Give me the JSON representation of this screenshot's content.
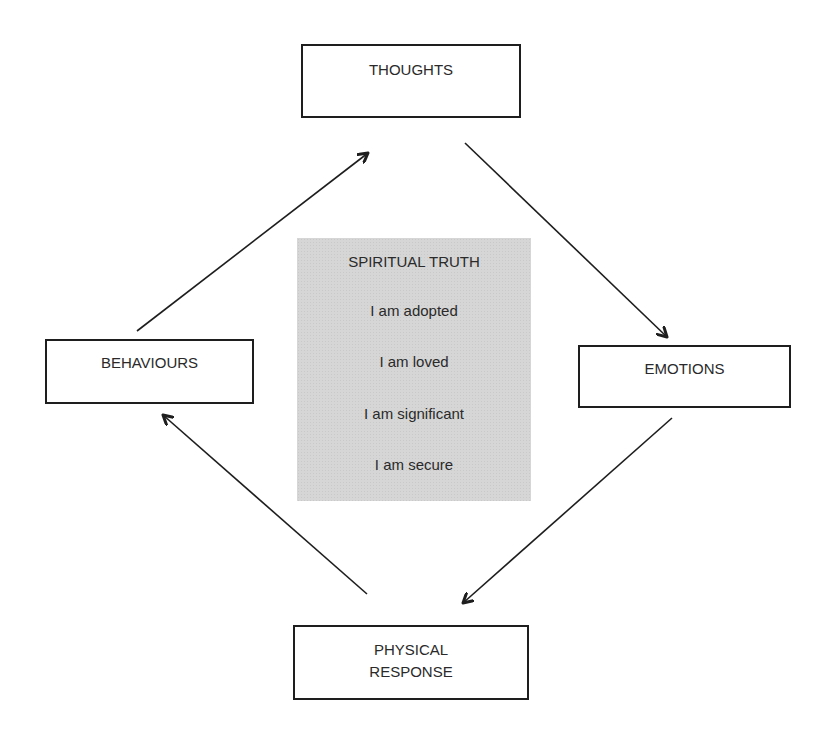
{
  "diagram": {
    "nodes": {
      "thoughts": {
        "label": "THOUGHTS"
      },
      "emotions": {
        "label": "EMOTIONS"
      },
      "behaviours": {
        "label": "BEHAVIOURS"
      },
      "physical": {
        "line1": "PHYSICAL",
        "line2": "RESPONSE"
      }
    },
    "center": {
      "title": "SPIRITUAL TRUTH",
      "statements": [
        "I am adopted",
        "I am loved",
        "I am significant",
        "I am secure"
      ]
    },
    "edges": [
      {
        "from": "BEHAVIOURS",
        "to": "THOUGHTS"
      },
      {
        "from": "THOUGHTS",
        "to": "EMOTIONS"
      },
      {
        "from": "EMOTIONS",
        "to": "PHYSICAL RESPONSE"
      },
      {
        "from": "PHYSICAL RESPONSE",
        "to": "BEHAVIOURS"
      }
    ],
    "colors": {
      "stroke": "#1e1e1e",
      "center_fill": "#d6d6d6",
      "background": "#ffffff"
    }
  }
}
